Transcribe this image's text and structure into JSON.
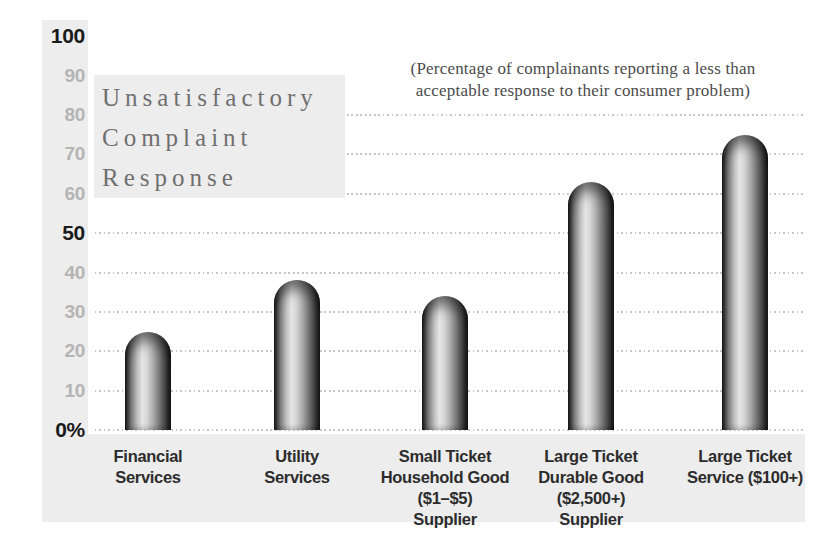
{
  "figure": {
    "title_lines": [
      "Unsatisfactory",
      "Complaint",
      "Response"
    ],
    "subtitle_lines": [
      "(Percentage of complainants reporting a less than",
      "acceptable response to their consumer problem)"
    ]
  },
  "chart_data": {
    "type": "bar",
    "title": "Unsatisfactory Complaint Response",
    "subtitle": "(Percentage of complainants reporting a less than acceptable response to their consumer problem)",
    "categories": [
      "Financial Services",
      "Utility Services",
      "Small Ticket Household Good ($1–$5) Supplier",
      "Large Ticket Durable Good ($2,500+) Supplier",
      "Large Ticket Service ($100+)"
    ],
    "category_label_lines": [
      [
        "Financial",
        "Services"
      ],
      [
        "Utility",
        "Services"
      ],
      [
        "Small Ticket",
        "Household Good",
        "($1–$5)",
        "Supplier"
      ],
      [
        "Large Ticket",
        "Durable Good",
        "($2,500+)",
        "Supplier"
      ],
      [
        "Large Ticket",
        "Service ($100+)"
      ]
    ],
    "values": [
      25,
      38,
      34,
      63,
      75
    ],
    "unit": "percent",
    "xlabel": "",
    "ylabel": "",
    "ylim": [
      0,
      100
    ],
    "yticks": [
      100,
      90,
      80,
      70,
      60,
      50,
      40,
      30,
      20,
      10,
      0
    ],
    "ytick_labels": [
      "100",
      "90",
      "80",
      "70",
      "60",
      "50",
      "40",
      "30",
      "20",
      "10",
      "0%"
    ],
    "emphasized_yticks": [
      100,
      50,
      0
    ],
    "gridlines_at": [
      80,
      70,
      60,
      50,
      40,
      30,
      20,
      10,
      0
    ],
    "grid_style": "dotted",
    "legend": "none",
    "bar_style": "rounded-top-cylinder-gradient"
  },
  "colors": {
    "background": "#ffffff",
    "panel_gray": "#ededed",
    "title_text": "#6f6f6f",
    "subtitle_text": "#4b4b4b",
    "tick_gray": "#b4b4b4",
    "tick_black": "#1b1b1b",
    "category_text": "#2c2c2c",
    "grid_dot": "#c6c6c6",
    "bar_dark": "#181818",
    "bar_light": "#e6e6e6"
  }
}
